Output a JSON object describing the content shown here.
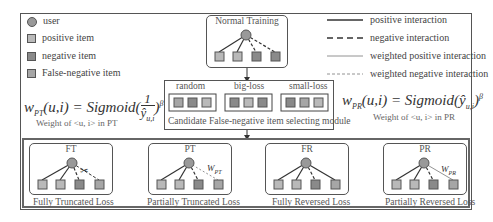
{
  "legend_left": {
    "items": [
      {
        "shape": "circle-icon",
        "label": "user"
      },
      {
        "shape": "square-icon",
        "label": "positive item"
      },
      {
        "shape": "square-icon",
        "label": "negative item"
      },
      {
        "shape": "square-icon",
        "label": "False-negative item"
      }
    ]
  },
  "legend_right": {
    "items": [
      {
        "line": "solid",
        "label": "positive interaction"
      },
      {
        "line": "dashed",
        "label": "negative interaction"
      },
      {
        "line": "thin-solid",
        "label": "weighted positive interaction"
      },
      {
        "line": "thin-dashed",
        "label": "weighted negative interaction"
      }
    ]
  },
  "normal_training": {
    "title": "Normal Training"
  },
  "candidate_module": {
    "groups": [
      "random",
      "big-loss",
      "small-loss"
    ],
    "caption": "Candidate False-negative item selecting module"
  },
  "formula_pt": {
    "lhs": "w",
    "lhs_sub": "PT",
    "args": "(u,i) = Sigmoid(",
    "fraction_num": "1",
    "fraction_den": "ŷ",
    "fraction_den_sub": "u,i",
    "close": ")",
    "exp": "β",
    "caption": "Weight of <u, i> in PT"
  },
  "formula_pr": {
    "lhs": "w",
    "lhs_sub": "PR",
    "args": "(u,i) = Sigmoid(",
    "inner": "ŷ",
    "inner_sub": "u,i",
    "close": ")",
    "exp": "β",
    "caption": "Weight of <u, i> in PR"
  },
  "methods": [
    {
      "short": "FT",
      "name": "Fully Truncated Loss"
    },
    {
      "short": "PT",
      "name": "Partially Truncated Loss",
      "weight": "W",
      "weight_sub": "PT"
    },
    {
      "short": "FR",
      "name": "Fully Reversed Loss"
    },
    {
      "short": "PR",
      "name": "Partially Reversed Loss",
      "weight": "W",
      "weight_sub": "PR"
    }
  ],
  "colors": {
    "user": "#999999",
    "positive": "#b9b9b9",
    "negative": "#8a8a8a",
    "false_negative": "#a6a6a6",
    "line": "#444444"
  }
}
